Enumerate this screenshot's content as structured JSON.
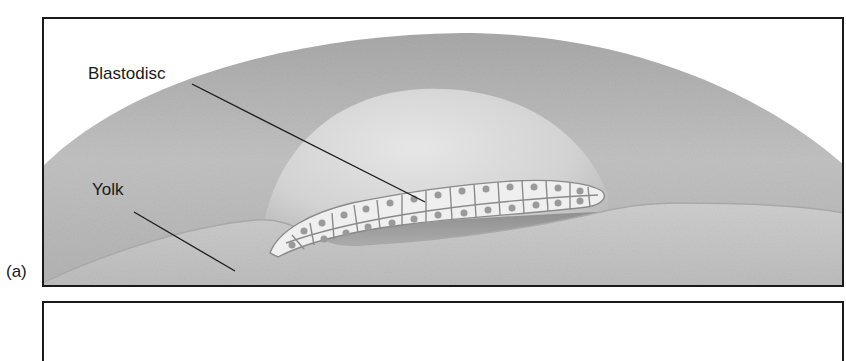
{
  "figure": {
    "panels": [
      {
        "label": "(a)",
        "callouts": [
          {
            "text": "Blastodisc",
            "target": "blastodisc cell layer"
          },
          {
            "text": "Yolk",
            "target": "yolk mass"
          }
        ]
      },
      {
        "label": "",
        "callouts": []
      }
    ],
    "colors": {
      "frame": "#1a1a1a",
      "outer_dome": "#b9b9b9",
      "inner_dome": "#d6d6d6",
      "yolk": "#c4c4c4",
      "cell_fill": "#efefef",
      "cell_outline": "#8a8a8a",
      "nucleus": "#9a9a9a",
      "leader_line": "#1a1a1a"
    }
  }
}
